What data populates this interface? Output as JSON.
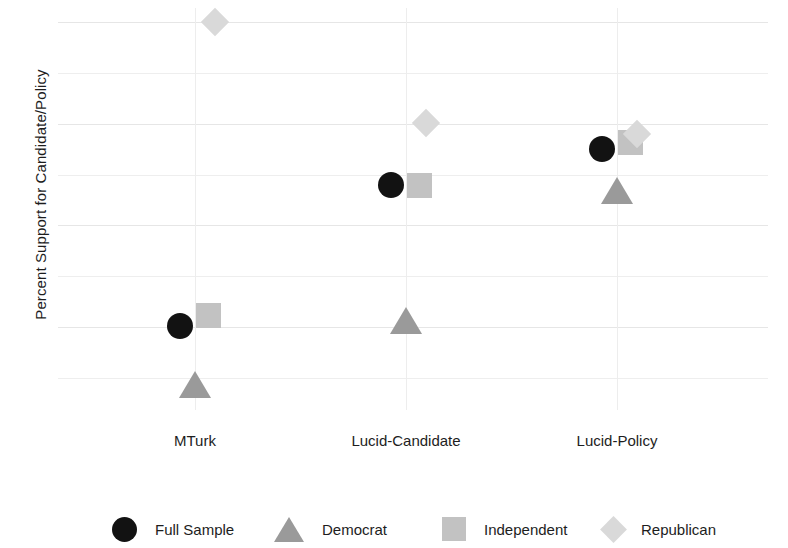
{
  "chart_data": {
    "type": "scatter",
    "title": "",
    "xlabel": "",
    "ylabel": "Percent Support for Candidate/Policy",
    "categories": [
      "MTurk",
      "Lucid-Candidate",
      "Lucid-Policy"
    ],
    "ylim": [
      2,
      41
    ],
    "yticks": [
      10,
      20,
      30,
      40
    ],
    "ytick_labels": [
      "10",
      "20",
      "30",
      "40"
    ],
    "yminor_gridlines": [
      5,
      15,
      25,
      35
    ],
    "grid": true,
    "legend_position": "bottom",
    "series": [
      {
        "name": "Full Sample",
        "marker": "circle",
        "color": "#121212",
        "values": [
          10.1,
          24.0,
          27.5
        ]
      },
      {
        "name": "Democrat",
        "marker": "triangle",
        "color": "#9a9a9a",
        "values": [
          4.2,
          10.5,
          23.3
        ]
      },
      {
        "name": "Independent",
        "marker": "square",
        "color": "#c2c2c2",
        "values": [
          11.2,
          24.0,
          28.2
        ]
      },
      {
        "name": "Republican",
        "marker": "diamond",
        "color": "#d9d9d9",
        "values": [
          40.0,
          30.1,
          29.0
        ]
      }
    ]
  }
}
